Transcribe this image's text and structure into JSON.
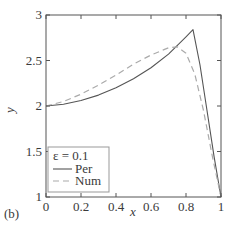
{
  "panel_label": "(b)",
  "chart_data": {
    "type": "line",
    "title": "",
    "xlabel": "x",
    "ylabel": "y",
    "xlim": [
      0,
      1
    ],
    "ylim": [
      1,
      3
    ],
    "xticks": [
      "0",
      "0.2",
      "0.4",
      "0.6",
      "0.8",
      "1"
    ],
    "yticks": [
      "1",
      "1.5",
      "2",
      "2.5",
      "3"
    ],
    "grid": false,
    "legend": {
      "title": "ε = 0.1",
      "position": "lower left",
      "entries": [
        "Per",
        "Num"
      ]
    },
    "series": [
      {
        "name": "Per",
        "style": "solid",
        "color": "#555555",
        "x": [
          0,
          0.1,
          0.2,
          0.3,
          0.4,
          0.5,
          0.6,
          0.7,
          0.8,
          0.84,
          0.88,
          0.92,
          0.96,
          1.0
        ],
        "y": [
          2.0,
          2.02,
          2.06,
          2.12,
          2.2,
          2.3,
          2.42,
          2.57,
          2.76,
          2.84,
          2.45,
          1.95,
          1.45,
          1.0
        ]
      },
      {
        "name": "Num",
        "style": "dashed",
        "color": "#aaaaaa",
        "x": [
          0,
          0.1,
          0.2,
          0.3,
          0.4,
          0.5,
          0.6,
          0.7,
          0.75,
          0.8,
          0.85,
          0.9,
          0.95,
          1.0
        ],
        "y": [
          2.0,
          2.05,
          2.13,
          2.23,
          2.34,
          2.46,
          2.56,
          2.64,
          2.65,
          2.58,
          2.35,
          1.95,
          1.45,
          1.0
        ]
      }
    ]
  }
}
